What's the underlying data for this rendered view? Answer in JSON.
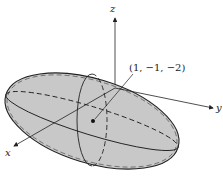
{
  "diagram": {
    "type": "ellipsoid-3d",
    "axes": {
      "x_label": "x",
      "y_label": "y",
      "z_label": "z"
    },
    "point": {
      "label": "(1, −1, −2)"
    },
    "colors": {
      "fill": "#c8c8c8",
      "stroke": "#222222"
    }
  }
}
